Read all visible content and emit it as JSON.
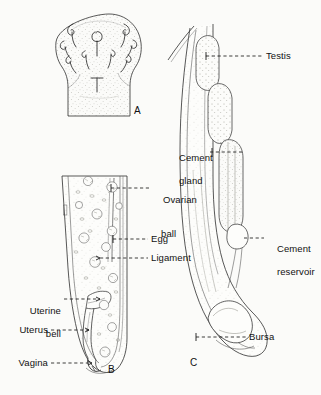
{
  "figure": {
    "background_color": "#fbfbf9",
    "ink_color": "#333333",
    "text_color": "#111111"
  },
  "panels": [
    {
      "letter": "A",
      "name": "proboscis",
      "description": "Proboscis armed with recurved hooks, stippled surface"
    },
    {
      "letter": "B",
      "name": "female-reproductive-tract",
      "description": "Posterior female body with ovarian balls, eggs, ligament, uterine bell, uterus, vagina"
    },
    {
      "letter": "C",
      "name": "male-posterior-end",
      "description": "Posterior male body with testes, cement glands, cement reservoir, bursa"
    }
  ],
  "labels": {
    "testis": "Testis",
    "cement_gland_line1": "Cement",
    "cement_gland_line2": "gland",
    "cement_reservoir_line1": "Cement",
    "cement_reservoir_line2": "reservoir",
    "bursa": "Bursa",
    "ovarian_ball_line1": "Ovarian",
    "ovarian_ball_line2": "ball",
    "egg": "Egg",
    "ligament": "Ligament",
    "uterine_bell_line1": "Uterine",
    "uterine_bell_line2": "bell",
    "uterus": "Uterus",
    "vagina": "Vagina"
  },
  "panel_letters": {
    "a": "A",
    "b": "B",
    "c": "C"
  }
}
